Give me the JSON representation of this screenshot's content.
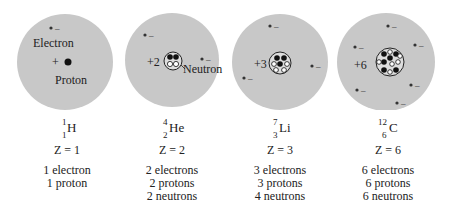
{
  "atoms": [
    {
      "symbol": "H",
      "mass_number": "1",
      "atomic_number": "1",
      "z_label": "Z = 1",
      "nucleus_charge": "+",
      "counts": [
        "1 electron",
        "1 proton"
      ],
      "annotations": {
        "electron": "Electron",
        "proton": "Proton"
      }
    },
    {
      "symbol": "He",
      "mass_number": "4",
      "atomic_number": "2",
      "z_label": "Z = 2",
      "nucleus_charge": "+2",
      "counts": [
        "2 electrons",
        "2 protons",
        "2 neutrons"
      ],
      "annotations": {
        "neutron": "Neutron"
      }
    },
    {
      "symbol": "Li",
      "mass_number": "7",
      "atomic_number": "3",
      "z_label": "Z = 3",
      "nucleus_charge": "+3",
      "counts": [
        "3 electrons",
        "3 protons",
        "4 neutrons"
      ]
    },
    {
      "symbol": "C",
      "mass_number": "12",
      "atomic_number": "6",
      "z_label": "Z = 6",
      "nucleus_charge": "+6",
      "counts": [
        "6 electrons",
        "6 protons",
        "6 neutrons"
      ]
    }
  ],
  "electron_sign": "–",
  "colors": {
    "cloud": "#c8c8c8",
    "particle_dark": "#111111",
    "particle_light": "#ffffff"
  }
}
